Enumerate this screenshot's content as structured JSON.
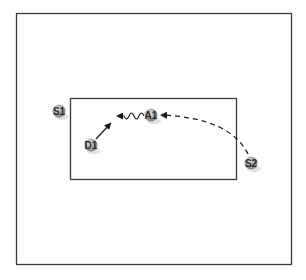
{
  "diagram": {
    "type": "play-diagram",
    "outer_frame": {
      "x": 16,
      "y": 13,
      "width": 275,
      "height": 251,
      "stroke": "#3a3a3a"
    },
    "inner_box": {
      "x": 70,
      "y": 98,
      "width": 166,
      "height": 81,
      "stroke": "#3a3a3a"
    },
    "colors": {
      "player_fill": "#9a9a9a",
      "player_highlight": "#d8d8d8",
      "player_shadow": "#cfcfcf",
      "line": "#1a1a1a"
    },
    "players": [
      {
        "id": "S1",
        "label": "S1",
        "x": 59,
        "y": 111
      },
      {
        "id": "A1",
        "label": "A1",
        "x": 151,
        "y": 115
      },
      {
        "id": "D1",
        "label": "D1",
        "x": 91,
        "y": 145
      },
      {
        "id": "S2",
        "label": "S2",
        "x": 251,
        "y": 163
      }
    ],
    "movements": [
      {
        "id": "d1-cut",
        "from": "D1",
        "style": "solid-arrow",
        "description": "D1 moves up toward ball"
      },
      {
        "id": "a1-dribble",
        "from": "A1",
        "style": "zigzag-arrow",
        "description": "A1 dribbles left"
      },
      {
        "id": "s2-pass",
        "from": "S2",
        "to": "A1",
        "style": "dashed-arrow",
        "description": "pass from S2 to A1"
      }
    ]
  }
}
